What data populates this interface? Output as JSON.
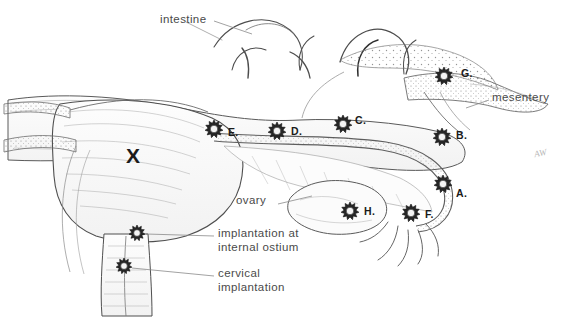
{
  "figure": {
    "background": "#ffffff",
    "ink": "#3a3a3a",
    "label_color": "#4a4a4a",
    "marker_color": "#1a1a1a",
    "width": 572,
    "height": 333
  },
  "labels": [
    {
      "name": "intestine",
      "text": "intestine",
      "x": 160,
      "y": 19
    },
    {
      "name": "mesentery",
      "text": "mesentery",
      "x": 492,
      "y": 97
    },
    {
      "name": "ovary",
      "text": "ovary",
      "x": 236,
      "y": 200
    },
    {
      "name": "internal-ostium",
      "text": "implantation at\ninternal ostium",
      "x": 218,
      "y": 232
    },
    {
      "name": "cervical",
      "text": "cervical\nimplantation",
      "x": 218,
      "y": 272
    }
  ],
  "markers": [
    {
      "id": "A",
      "label": "A.",
      "site": "tubal-ampullary",
      "star_x": 443,
      "star_y": 184,
      "text_x": 456,
      "text_y": 193
    },
    {
      "id": "B",
      "label": "B.",
      "site": "tubal-isthmic",
      "star_x": 442,
      "star_y": 137,
      "text_x": 456,
      "text_y": 135
    },
    {
      "id": "C",
      "label": "C.",
      "site": "tubal-interstitial",
      "star_x": 343,
      "star_y": 124,
      "text_x": 355,
      "text_y": 120
    },
    {
      "id": "D",
      "label": "D.",
      "site": "cornual",
      "star_x": 277,
      "star_y": 131,
      "text_x": 291,
      "text_y": 131
    },
    {
      "id": "E",
      "label": "E.",
      "site": "uterine-fundus",
      "star_x": 214,
      "star_y": 129,
      "text_x": 228,
      "text_y": 132
    },
    {
      "id": "F",
      "label": "F.",
      "site": "fimbrial",
      "star_x": 411,
      "star_y": 213,
      "text_x": 425,
      "text_y": 214
    },
    {
      "id": "G",
      "label": "G.",
      "site": "abdominal",
      "star_x": 444,
      "star_y": 76,
      "text_x": 461,
      "text_y": 73
    },
    {
      "id": "H",
      "label": "H.",
      "site": "ovarian",
      "star_x": 350,
      "star_y": 211,
      "text_x": 364,
      "text_y": 211
    }
  ],
  "unlabeled_markers": [
    {
      "name": "internal-ostium-star",
      "star_x": 137,
      "star_y": 233
    },
    {
      "name": "cervical-star",
      "star_x": 124,
      "star_y": 266
    }
  ],
  "uterus_marker": {
    "name": "uterus-x",
    "text": "X",
    "x": 133,
    "y": 155
  },
  "signature": {
    "text": "AW",
    "x": 538,
    "y": 155
  }
}
